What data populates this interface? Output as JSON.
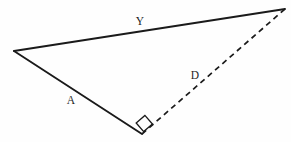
{
  "figure": {
    "type": "geometry-diagram",
    "shape": "triangle",
    "background_color": "#fefefe",
    "stroke_color": "#1a1a1a",
    "canvas": {
      "width": 291,
      "height": 142
    }
  },
  "vertices": {
    "left": {
      "name": "left-vertex",
      "x": 14,
      "y": 51
    },
    "right": {
      "name": "right-vertex",
      "x": 285,
      "y": 9
    },
    "bottom": {
      "name": "bottom-vertex",
      "x": 142,
      "y": 134
    }
  },
  "edges": [
    {
      "id": "top-edge",
      "name": "edge-y",
      "style": "solid",
      "label": "Y",
      "from": "left",
      "to": "right"
    },
    {
      "id": "left-edge",
      "name": "edge-a",
      "style": "solid",
      "label": "A",
      "from": "left",
      "to": "bottom"
    },
    {
      "id": "diagonal-edge",
      "name": "edge-d",
      "style": "dashed",
      "label": "D",
      "from": "bottom",
      "to": "right"
    }
  ],
  "labels": {
    "y": {
      "text": "Y",
      "x": 140,
      "y": 22
    },
    "a": {
      "text": "A",
      "x": 71,
      "y": 101
    },
    "d": {
      "text": "D",
      "x": 195,
      "y": 76
    }
  },
  "angle_marker": {
    "name": "right-angle-marker",
    "type": "right-angle-square",
    "at_vertex": "bottom",
    "size": 11
  }
}
